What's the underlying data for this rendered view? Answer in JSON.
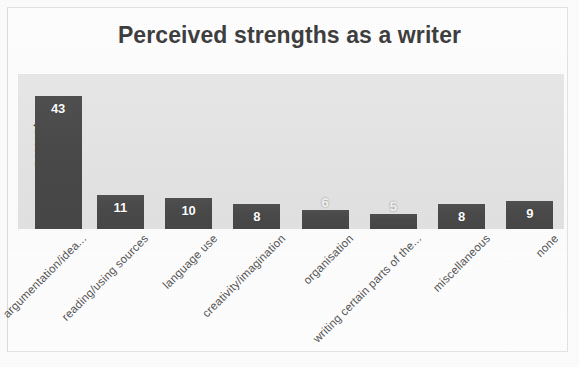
{
  "chart_data": {
    "type": "bar",
    "title": "Perceived strengths as a writer",
    "xlabel": "",
    "ylabel": "percent",
    "ylim": [
      0,
      50
    ],
    "grid": false,
    "legend": null,
    "categories": [
      "argumentation/idea...",
      "reading/using sources",
      "language use",
      "creativity/imagination",
      "organisation",
      "writing certain parts of the...",
      "miscellaneous",
      "none"
    ],
    "values": [
      43,
      11,
      10,
      8,
      6,
      5,
      8,
      9
    ],
    "data_labels": [
      "43",
      "11",
      "10",
      "8",
      "6",
      "5",
      "8",
      "9"
    ],
    "colors": {
      "bar_fill": "#4a4a4a",
      "plot_background": "#e6e6e6",
      "title_text": "#3f3f3f",
      "category_text": "#545454",
      "value_text": "#ffffff"
    }
  }
}
